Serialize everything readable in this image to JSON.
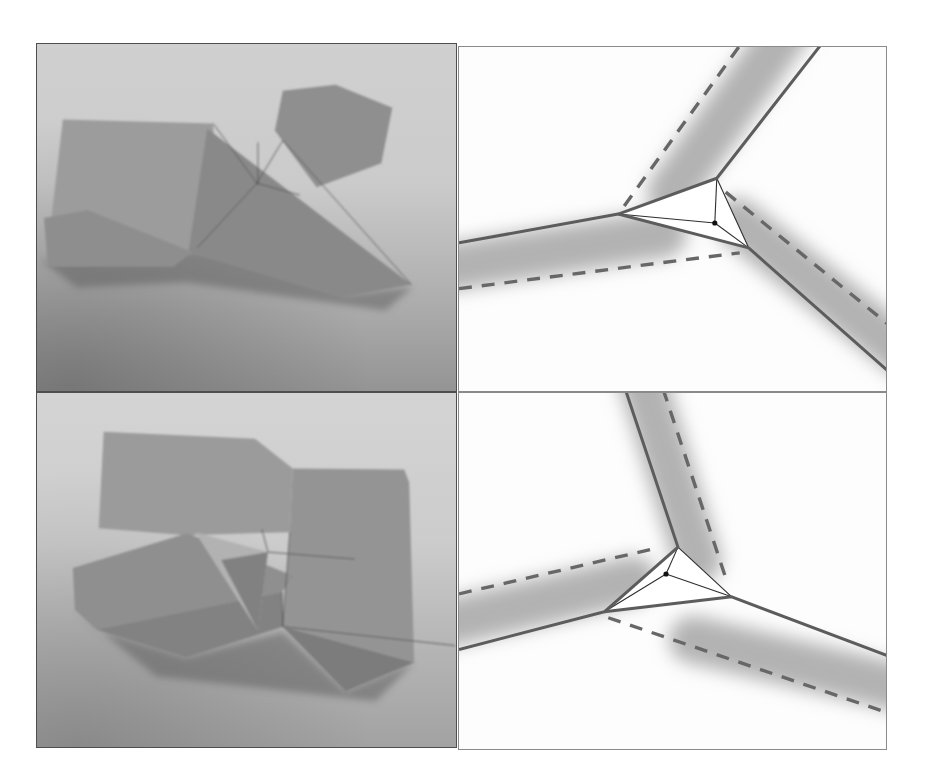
{
  "colors": {
    "page_bg": "#ffffff",
    "photo_frame": "#4e4e4e",
    "diagram_frame": "#8a8a8a",
    "solid_fold_line": "#5c5c5c",
    "dashed_fold_line": "#676767",
    "thin_triangle_line": "#2e2e2e",
    "vertex_dot": "#111111",
    "shaded_band": "#b2b2b2",
    "paper_gray_light": "#b2b2b2",
    "paper_gray_mid": "#9c9c9c",
    "paper_gray_dark": "#7c7c7c"
  },
  "photo1": {
    "shadow": "5,218 185,206 310,252 378,244 350,268 150,240 40,245",
    "back_sheet": "26,76 177,80 184,209 9,222",
    "wing": "247,47 300,41 357,64 346,120 281,144 239,87",
    "front_triangle": "171,85 376,242 307,255 152,210",
    "bottom_flap": "7,175 51,167 156,209 137,224 11,224",
    "creases": [
      "M221,140 L177,80",
      "M221,140 L247,97",
      "M221,140 L264,152",
      "M221,140 L161,205",
      "M222,99 L222,142",
      "M247,97 L376,242"
    ]
  },
  "photo2": {
    "shadow": "38,218 60,238 150,266 247,240 310,300 379,271 340,310 120,285",
    "back_sheet": "67,39 219,46 257,76 254,140 150,143 62,136",
    "right_sheet": "257,76 369,77 374,90 379,271 247,235 254,140",
    "left_flap": "36,176 151,141 258,184 246,200 60,238 38,218",
    "bottom_triangle": "60,238 246,200 247,235 150,266",
    "bottom_right_triangle": "247,235 379,271 310,300",
    "raised_flap_light": "159,140 232,160 222,239",
    "raised_flap_dark": "185,168 232,160 222,239",
    "creases": [
      "M232,160 L319,167",
      "M232,160 L226,137",
      "M254,140 L247,235",
      "M247,235 L420,254",
      "M246,200 L247,235"
    ]
  },
  "diagram1": {
    "bands": [
      "M330,-18 L213,146",
      "M-14,222 L205,188",
      "M280,176 L446,308"
    ],
    "white_triangle": "259,132 160,168 291,202",
    "solid_segments": [
      "M365,-4 L259,132 L160,168 L0,197",
      "M160,168 L291,202 L430,325"
    ],
    "dashed_segments": [
      "M166,160 L284,-4",
      "M0,243 L282,207",
      "M268,146 L430,278"
    ],
    "thin_segments": [
      "M259,132 L291,202",
      "M257,177 L259,132",
      "M257,177 L160,168",
      "M257,177 L291,202"
    ],
    "dot": "M254.4,177 a2.6,2.6 0 1,0 5.2,0 a2.6,2.6 0 1,0 -5.2,0"
  },
  "diagram2": {
    "bands": [
      "M182,-20 L240,168",
      "M-15,232 L175,188",
      "M235,248 L445,297"
    ],
    "white_triangle": "220,155 146,220 274,205",
    "solid_segments": [
      "M167,-4 L220,155 L146,220 L0,258",
      "M146,220 L274,205 L430,264"
    ],
    "dashed_segments": [
      "M205,-4 L270,192",
      "M0,202 L194,157",
      "M150,226 L432,322"
    ],
    "thin_segments": [
      "M220,155 L274,205",
      "M208,182 L220,155",
      "M208,182 L146,220",
      "M208,182 L274,205"
    ],
    "dot": "M205.4,182 a2.6,2.6 0 1,0 5.2,0 a2.6,2.6 0 1,0 -5.2,0"
  }
}
